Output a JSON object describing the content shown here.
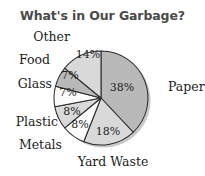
{
  "chart_data": {
    "type": "pie",
    "title": "What's in Our Garbage?",
    "xlabel": "",
    "ylabel": "",
    "legend_position": "none",
    "grid": false,
    "start_angle_deg": 0,
    "direction": "clockwise",
    "categories": [
      "Paper",
      "Yard Waste",
      "Metals",
      "Plastic",
      "Glass",
      "Food",
      "Other"
    ],
    "values": [
      38,
      18,
      8,
      8,
      7,
      7,
      14
    ],
    "value_unit": "%",
    "slices": [
      {
        "name": "Paper",
        "label": "Paper",
        "value": 38,
        "value_label": "38%",
        "color": "#b9b9b9",
        "label_x": 168,
        "label_y": 87,
        "label_align": "right",
        "pct_x": 122,
        "pct_y": 87
      },
      {
        "name": "Yard Waste",
        "label": "Yard Waste",
        "value": 18,
        "value_label": "18%",
        "color": "#d9d9d9",
        "label_x": 113,
        "label_y": 162,
        "label_align": "center",
        "pct_x": 108,
        "pct_y": 131
      },
      {
        "name": "Metals",
        "label": "Metals",
        "value": 8,
        "value_label": "8%",
        "color": "#fbfbfb",
        "label_x": 62,
        "label_y": 145,
        "label_align": "left",
        "pct_x": 80,
        "pct_y": 124
      },
      {
        "name": "Plastic",
        "label": "Plastic",
        "value": 8,
        "value_label": "8%",
        "color": "#d9d9d9",
        "label_x": 58,
        "label_y": 122,
        "label_align": "left",
        "pct_x": 72,
        "pct_y": 111
      },
      {
        "name": "Glass",
        "label": "Glass",
        "value": 7,
        "value_label": "7%",
        "color": "#fbfbfb",
        "label_x": 52,
        "label_y": 84,
        "label_align": "left",
        "pct_x": 68,
        "pct_y": 92
      },
      {
        "name": "Food",
        "label": "Food",
        "value": 7,
        "value_label": "7%",
        "color": "#b9b9b9",
        "label_x": 50,
        "label_y": 60,
        "label_align": "left",
        "pct_x": 70,
        "pct_y": 75
      },
      {
        "name": "Other",
        "label": "Other",
        "value": 14,
        "value_label": "14%",
        "color": "#d9d9d9",
        "label_x": 70,
        "label_y": 37,
        "label_align": "left",
        "pct_x": 88,
        "pct_y": 54
      }
    ],
    "geometry": {
      "center_x": 101,
      "center_y": 98,
      "radius": 47
    },
    "style": {
      "title_color": "#4a4a4a",
      "label_color": "#1d1d1d",
      "outline_color": "#2b2b2b",
      "background": "#ffffff",
      "shadow_color": "#c9c9c9"
    }
  }
}
